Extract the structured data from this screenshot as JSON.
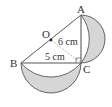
{
  "diagram": {
    "points": {
      "A": {
        "label": "A",
        "x": 81,
        "y": 15
      },
      "O": {
        "label": "O",
        "x": 51,
        "y": 40
      },
      "B": {
        "label": "B",
        "x": 21,
        "y": 63
      },
      "C": {
        "label": "C",
        "x": 81,
        "y": 63
      }
    },
    "measurements": {
      "OA": "6 cm",
      "OC": "5 cm"
    },
    "colors": {
      "stroke": "#444444",
      "shade": "#d6d6d6"
    }
  }
}
